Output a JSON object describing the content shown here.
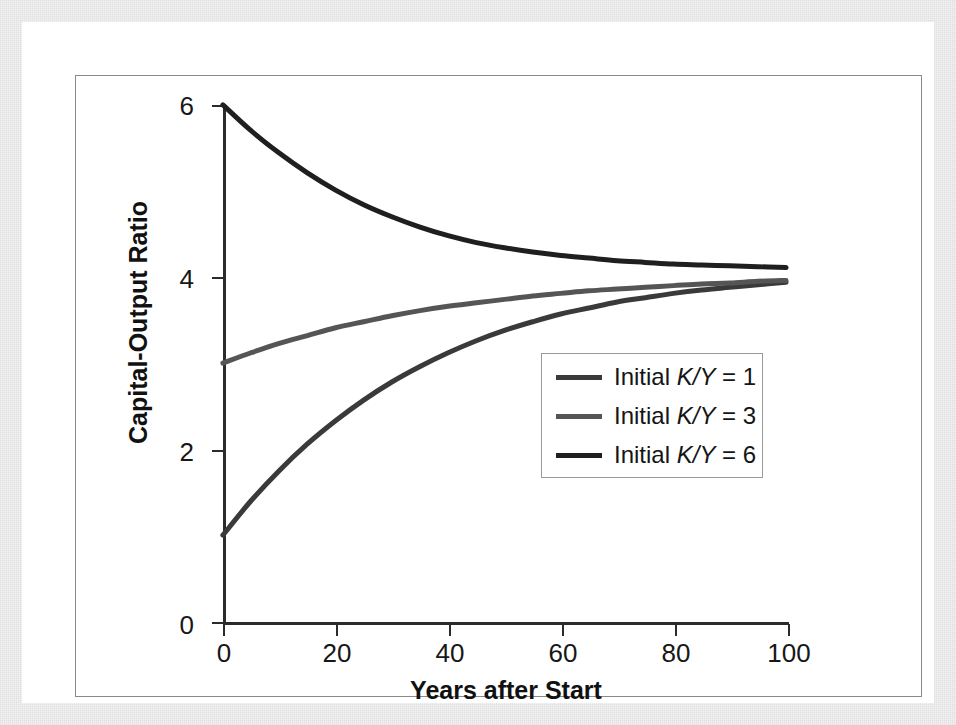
{
  "figure": {
    "background_color": "#ffffff",
    "frame_color": "#8a8a8a"
  },
  "chart_data": {
    "type": "line",
    "title": "",
    "xlabel": "Years after Start",
    "ylabel": "Capital-Output Ratio",
    "xlim": [
      0,
      100
    ],
    "ylim": [
      0,
      6
    ],
    "xticks": [
      "0",
      "20",
      "40",
      "60",
      "80",
      "100"
    ],
    "xtick_values": [
      0,
      20,
      40,
      60,
      80,
      100
    ],
    "yticks": [
      "0",
      "2",
      "4",
      "6"
    ],
    "ytick_values": [
      0,
      2,
      4,
      6
    ],
    "grid": false,
    "legend_position": "center-right",
    "legend_entries": [
      "Initial K/Y = 1",
      "Initial K/Y = 3",
      "Initial K/Y = 6"
    ],
    "x": [
      0,
      5,
      10,
      15,
      20,
      25,
      30,
      35,
      40,
      45,
      50,
      55,
      60,
      65,
      70,
      75,
      80,
      85,
      90,
      95,
      100
    ],
    "series": [
      {
        "name": "Initial K/Y = 1",
        "color": "#3a3a3a",
        "initial_value": 1,
        "converges_to": 4.0,
        "values": [
          1.0,
          1.4,
          1.75,
          2.06,
          2.33,
          2.57,
          2.78,
          2.96,
          3.12,
          3.26,
          3.38,
          3.48,
          3.57,
          3.64,
          3.71,
          3.76,
          3.81,
          3.85,
          3.88,
          3.91,
          3.94
        ]
      },
      {
        "name": "Initial K/Y = 3",
        "color": "#555555",
        "initial_value": 3,
        "converges_to": 4.0,
        "values": [
          3.0,
          3.12,
          3.23,
          3.32,
          3.41,
          3.48,
          3.55,
          3.61,
          3.66,
          3.7,
          3.74,
          3.78,
          3.81,
          3.84,
          3.86,
          3.88,
          3.9,
          3.92,
          3.93,
          3.95,
          3.96
        ]
      },
      {
        "name": "Initial K/Y = 6",
        "color": "#1f1f1f",
        "initial_value": 6,
        "converges_to": 4.1,
        "values": [
          6.0,
          5.7,
          5.44,
          5.21,
          5.01,
          4.84,
          4.7,
          4.58,
          4.48,
          4.4,
          4.34,
          4.29,
          4.25,
          4.22,
          4.19,
          4.17,
          4.15,
          4.14,
          4.13,
          4.12,
          4.11
        ]
      }
    ]
  },
  "legend": {
    "items": [
      {
        "label_prefix": "Initial ",
        "label_symbol": "K/Y",
        "label_suffix": " = 1",
        "swatch_color": "#3a3a3a"
      },
      {
        "label_prefix": "Initial ",
        "label_symbol": "K/Y",
        "label_suffix": " = 3",
        "swatch_color": "#555555"
      },
      {
        "label_prefix": "Initial ",
        "label_symbol": "K/Y",
        "label_suffix": " = 6",
        "swatch_color": "#1f1f1f"
      }
    ]
  },
  "axes": {
    "x_title": "Years after Start",
    "y_title": "Capital-Output Ratio",
    "x_tick_labels": [
      "0",
      "20",
      "40",
      "60",
      "80",
      "100"
    ],
    "y_tick_labels": [
      "0",
      "2",
      "4",
      "6"
    ]
  }
}
